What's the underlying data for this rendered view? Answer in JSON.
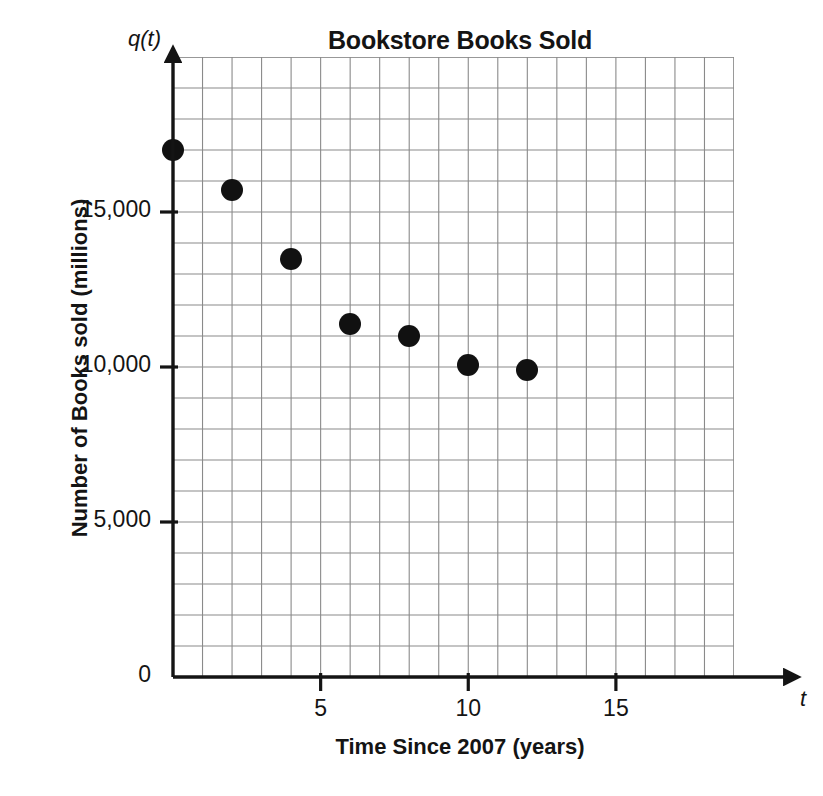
{
  "chart_data": {
    "type": "scatter",
    "title": "Bookstore Books Sold",
    "xlabel": "Time Since 2007 (years)",
    "ylabel": "Number of Books sold (millions)",
    "x_variable": "t",
    "y_variable": "q(t)",
    "xlim": [
      0,
      19
    ],
    "ylim": [
      0,
      20000
    ],
    "grid": true,
    "grid_x_step": 1,
    "grid_y_step": 1000,
    "legend": "none",
    "x_ticks": [
      {
        "value": 5,
        "label": "5"
      },
      {
        "value": 10,
        "label": "10"
      },
      {
        "value": 15,
        "label": "15"
      }
    ],
    "y_ticks": [
      {
        "value": 0,
        "label": "0"
      },
      {
        "value": 5000,
        "label": "5,000"
      },
      {
        "value": 10000,
        "label": "10,000"
      },
      {
        "value": 15000,
        "label": "15,000"
      }
    ],
    "x": [
      0,
      2,
      4,
      6,
      8,
      10,
      12
    ],
    "values": [
      17000,
      15700,
      13500,
      11400,
      11000,
      10050,
      9900
    ],
    "points": [
      {
        "t": 0,
        "q": 17000
      },
      {
        "t": 2,
        "q": 15700
      },
      {
        "t": 4,
        "q": 13500
      },
      {
        "t": 6,
        "q": 11400
      },
      {
        "t": 8,
        "q": 11000
      },
      {
        "t": 10,
        "q": 10050
      },
      {
        "t": 12,
        "q": 9900
      }
    ],
    "marker": {
      "shape": "circle",
      "color": "#111111",
      "size": 22
    },
    "colors": {
      "grid": "#8a8a8a",
      "axis": "#141414",
      "text": "#141414"
    }
  }
}
